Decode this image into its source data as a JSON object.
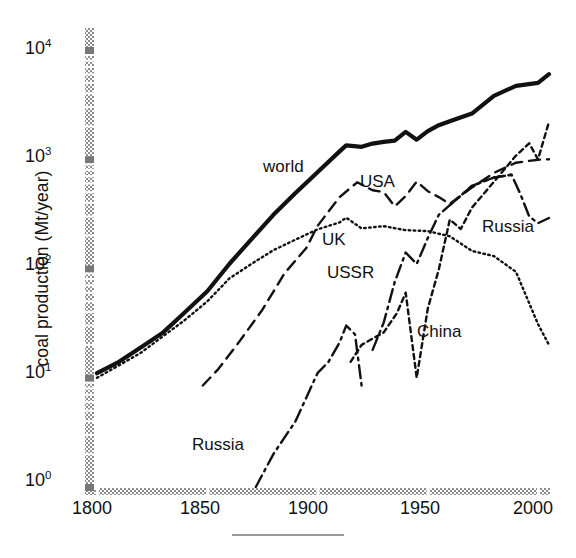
{
  "chart_data": {
    "type": "line",
    "title": "",
    "xlabel": "",
    "ylabel": "coal production (Mt/year)",
    "xlim": [
      1795,
      2010
    ],
    "ylim": [
      1,
      20000
    ],
    "yscale": "log",
    "xscale": "linear",
    "grid": false,
    "legend_position": "inline-annotations",
    "xticks": [
      1800,
      1850,
      1900,
      1950,
      2000
    ],
    "xticklabels": [
      "1800",
      "1850",
      "1900",
      "1950",
      "2000"
    ],
    "yticks": [
      1,
      10,
      100,
      1000,
      10000
    ],
    "yticklabels": [
      "10",
      "10",
      "10",
      "10",
      "10"
    ],
    "ytick_exponents": [
      "0",
      "1",
      "2",
      "3",
      "4"
    ],
    "series": [
      {
        "name": "world",
        "style": "solid",
        "label_x": 1870,
        "label_y": 700,
        "x": [
          1800,
          1810,
          1820,
          1830,
          1840,
          1850,
          1860,
          1870,
          1880,
          1890,
          1900,
          1910,
          1913,
          1920,
          1925,
          1930,
          1935,
          1940,
          1945,
          1950,
          1955,
          1960,
          1970,
          1980,
          1990,
          2000,
          2005
        ],
        "y": [
          11,
          14,
          19,
          26,
          40,
          62,
          110,
          185,
          310,
          490,
          760,
          1180,
          1340,
          1300,
          1390,
          1440,
          1480,
          1780,
          1510,
          1810,
          2050,
          2230,
          2620,
          3800,
          4700,
          5000,
          6000
        ]
      },
      {
        "name": "UK",
        "style": "dotted",
        "label_x": 1905,
        "label_y": 130,
        "x": [
          1800,
          1820,
          1840,
          1850,
          1860,
          1870,
          1880,
          1890,
          1900,
          1910,
          1913,
          1920,
          1930,
          1940,
          1950,
          1960,
          1970,
          1980,
          1990,
          2000,
          2005
        ],
        "y": [
          10,
          17,
          34,
          50,
          81,
          110,
          147,
          184,
          228,
          264,
          292,
          233,
          244,
          224,
          220,
          197,
          145,
          130,
          93,
          31,
          20
        ]
      },
      {
        "name": "USA",
        "style": "dashed",
        "label_x": 1925,
        "label_y": 560,
        "x": [
          1848,
          1855,
          1865,
          1875,
          1885,
          1895,
          1900,
          1910,
          1918,
          1925,
          1930,
          1935,
          1940,
          1945,
          1950,
          1955,
          1960,
          1970,
          1980,
          1990,
          2000,
          2005
        ],
        "y": [
          8.5,
          12,
          22,
          42,
          90,
          155,
          245,
          450,
          615,
          520,
          500,
          370,
          460,
          625,
          510,
          450,
          390,
          550,
          750,
          930,
          990,
          1000
        ]
      },
      {
        "name": "USSR",
        "style": "dashdot",
        "label_x": 1917,
        "label_y": 78,
        "x": [
          1925,
          1930,
          1935,
          1940,
          1945,
          1950,
          1955,
          1960,
          1970,
          1980,
          1988
        ],
        "y": [
          18,
          32,
          75,
          140,
          110,
          190,
          310,
          380,
          570,
          680,
          720
        ]
      },
      {
        "name": "Russia",
        "style": "dashdot",
        "label_x": 1836,
        "label_y": 3.0,
        "x": [
          1872,
          1880,
          1890,
          1900,
          1905,
          1910,
          1913,
          1917,
          1920
        ],
        "y": [
          1.0,
          2.0,
          4.0,
          11,
          14,
          21,
          30,
          25,
          8.5
        ]
      },
      {
        "name": "Russia",
        "style": "dashdot",
        "label_x": 1984,
        "label_y": 185,
        "x": [
          1960,
          1970,
          1980,
          1988,
          1992,
          1996,
          2000,
          2005
        ],
        "y": [
          380,
          570,
          680,
          720,
          480,
          300,
          260,
          290
        ]
      },
      {
        "name": "China",
        "style": "finedash",
        "label_x": 1947,
        "label_y": 42,
        "x": [
          1915,
          1920,
          1930,
          1936,
          1940,
          1945,
          1950,
          1955,
          1960,
          1965,
          1970,
          1980,
          1990,
          1996,
          2000,
          2005
        ],
        "y": [
          14,
          20,
          26,
          39,
          60,
          10,
          43,
          98,
          280,
          230,
          360,
          620,
          1080,
          1400,
          1000,
          2200
        ]
      }
    ],
    "annotations": [
      {
        "text": "world",
        "x": 263,
        "y": 157
      },
      {
        "text": "USA",
        "x": 360,
        "y": 172
      },
      {
        "text": "UK",
        "x": 322,
        "y": 230
      },
      {
        "text": "USSR",
        "x": 327,
        "y": 263
      },
      {
        "text": "China",
        "x": 417,
        "y": 322
      },
      {
        "text": "Russia",
        "x": 482,
        "y": 217
      },
      {
        "text": "Russia",
        "x": 192,
        "y": 435
      }
    ]
  },
  "figure": {
    "ylabel": "coal production (Mt/year)",
    "ytick_labels": [
      {
        "mantissa": "10",
        "exp": "4"
      },
      {
        "mantissa": "10",
        "exp": "3"
      },
      {
        "mantissa": "10",
        "exp": "2"
      },
      {
        "mantissa": "10",
        "exp": "1"
      },
      {
        "mantissa": "10",
        "exp": "0"
      }
    ],
    "xtick_labels": [
      "1800",
      "1850",
      "1900",
      "1950",
      "2000"
    ],
    "axis_color": "#8a8a8a",
    "line_color": "#111111"
  }
}
